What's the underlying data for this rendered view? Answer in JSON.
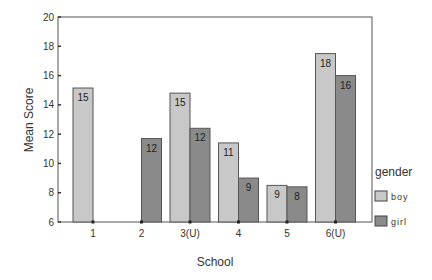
{
  "chart_data": {
    "type": "bar",
    "title": "",
    "xlabel": "School",
    "ylabel": "Mean Score",
    "ylim": [
      6,
      20
    ],
    "yticks": [
      6,
      8,
      10,
      12,
      14,
      16,
      18,
      20
    ],
    "grid": false,
    "categories": [
      "1",
      "2",
      "3(U)",
      "4",
      "5",
      "6(U)"
    ],
    "legend_title": "gender",
    "legend_position": "right",
    "series": [
      {
        "name": "boy",
        "color": "#c8c8c8",
        "values": [
          15.15,
          null,
          14.8,
          11.4,
          8.5,
          17.5
        ],
        "labels": [
          "15",
          null,
          "15",
          "11",
          "9",
          "18"
        ]
      },
      {
        "name": "girl",
        "color": "#8a8a8a",
        "values": [
          null,
          11.7,
          12.4,
          9.0,
          8.4,
          16.0
        ],
        "labels": [
          null,
          "12",
          "12",
          "9",
          "8",
          "16"
        ]
      }
    ]
  }
}
